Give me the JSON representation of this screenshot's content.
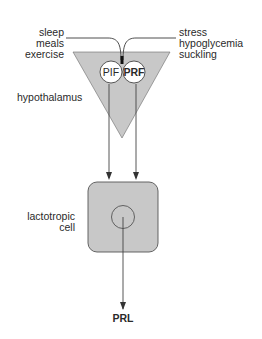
{
  "diagram": {
    "left_inputs": [
      "sleep",
      "meals",
      "exercise"
    ],
    "right_inputs": [
      "stress",
      "hypoglycemia",
      "suckling"
    ],
    "region_label": "hypothalamus",
    "factors": [
      {
        "label": "PIF",
        "bold": false
      },
      {
        "label": "PRF",
        "bold": true
      }
    ],
    "cell_label": [
      "lactotropic",
      "cell"
    ],
    "output_label": "PRL",
    "colors": {
      "fill": "#c8c8c8",
      "stroke": "#4a4a4a",
      "circle_fill": "#ffffff"
    }
  }
}
